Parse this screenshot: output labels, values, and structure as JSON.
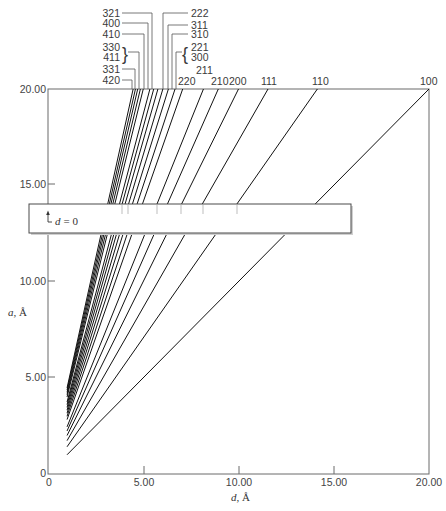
{
  "figure": {
    "y_label": {
      "var": "a",
      "unit": ", Å"
    },
    "x_label": {
      "var": "d",
      "unit": ", Å"
    },
    "y_ticks": [
      "20.00",
      "15.00",
      "10.00",
      "5.00",
      "0"
    ],
    "x_ticks": [
      "0",
      "5.00",
      "10.00",
      "15.00",
      "20.00"
    ],
    "inset_annotation": {
      "var": "d",
      "rest": "= 0"
    },
    "hkl_labels": {
      "l321": "321",
      "l400": "400",
      "l410": "410",
      "l330": "330",
      "l411": "411",
      "l331": "331",
      "l420": "420",
      "l222": "222",
      "l311": "311",
      "l310": "310",
      "l221": "221",
      "l300": "300",
      "l211": "211",
      "l220": "220",
      "l210": "210",
      "l200": "200",
      "l111": "111",
      "l110": "110",
      "l100": "100"
    },
    "bracket_left": "}",
    "bracket_right": "{"
  },
  "chart_data": {
    "type": "line",
    "title": "",
    "xlabel": "d, Å",
    "ylabel": "a, Å",
    "xlim": [
      0,
      20
    ],
    "ylim": [
      0,
      20
    ],
    "xticks": [
      0,
      5,
      10,
      15,
      20
    ],
    "yticks": [
      0,
      5,
      10,
      15,
      20
    ],
    "grid": false,
    "legend": "none (lines labeled at top edge by Miller indices hkl)",
    "relation": "a = d * sqrt(h^2 + k^2 + l^2)",
    "series": [
      {
        "name": "100",
        "sum_sq": 1,
        "points": [
          [
            1,
            1.0
          ],
          [
            20.0,
            20
          ]
        ]
      },
      {
        "name": "110",
        "sum_sq": 2,
        "points": [
          [
            1,
            1.414
          ],
          [
            14.14,
            20
          ]
        ]
      },
      {
        "name": "111",
        "sum_sq": 3,
        "points": [
          [
            1,
            1.732
          ],
          [
            11.55,
            20
          ]
        ]
      },
      {
        "name": "200",
        "sum_sq": 4,
        "points": [
          [
            1,
            2.0
          ],
          [
            10.0,
            20
          ]
        ]
      },
      {
        "name": "210",
        "sum_sq": 5,
        "points": [
          [
            1,
            2.236
          ],
          [
            8.94,
            20
          ]
        ]
      },
      {
        "name": "211",
        "sum_sq": 6,
        "points": [
          [
            1,
            2.449
          ],
          [
            8.16,
            20
          ]
        ]
      },
      {
        "name": "220",
        "sum_sq": 8,
        "points": [
          [
            1,
            2.828
          ],
          [
            7.07,
            20
          ]
        ]
      },
      {
        "name": "221, 300",
        "sum_sq": 9,
        "points": [
          [
            1,
            3.0
          ],
          [
            6.67,
            20
          ]
        ]
      },
      {
        "name": "310",
        "sum_sq": 10,
        "points": [
          [
            1,
            3.162
          ],
          [
            6.32,
            20
          ]
        ]
      },
      {
        "name": "311",
        "sum_sq": 11,
        "points": [
          [
            1,
            3.317
          ],
          [
            6.03,
            20
          ]
        ]
      },
      {
        "name": "222",
        "sum_sq": 12,
        "points": [
          [
            1,
            3.464
          ],
          [
            5.77,
            20
          ]
        ]
      },
      {
        "name": "",
        "sum_sq": 13,
        "points": [
          [
            1,
            3.606
          ],
          [
            5.55,
            20
          ]
        ]
      },
      {
        "name": "321",
        "sum_sq": 14,
        "points": [
          [
            1,
            3.742
          ],
          [
            5.35,
            20
          ]
        ]
      },
      {
        "name": "400",
        "sum_sq": 16,
        "points": [
          [
            1,
            4.0
          ],
          [
            5.0,
            20
          ]
        ]
      },
      {
        "name": "410",
        "sum_sq": 17,
        "points": [
          [
            1,
            4.123
          ],
          [
            4.85,
            20
          ]
        ]
      },
      {
        "name": "330, 411",
        "sum_sq": 18,
        "points": [
          [
            1,
            4.243
          ],
          [
            4.71,
            20
          ]
        ]
      },
      {
        "name": "331",
        "sum_sq": 19,
        "points": [
          [
            1,
            4.359
          ],
          [
            4.59,
            20
          ]
        ]
      },
      {
        "name": "420",
        "sum_sq": 20,
        "points": [
          [
            1,
            4.472
          ],
          [
            4.47,
            20
          ]
        ]
      }
    ],
    "annotations": [
      "d = 0 (inset strip marking axis break)"
    ]
  }
}
